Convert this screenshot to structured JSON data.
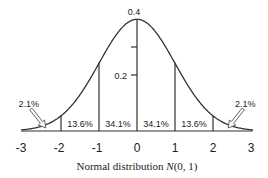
{
  "chart_data": {
    "type": "line",
    "title": "",
    "xlabel_prefix": "Normal distribution ",
    "xlabel_symbol": "N",
    "xlabel_suffix": "(0, 1)",
    "ylabel": "",
    "xlim": [
      -3,
      3
    ],
    "ylim": [
      0,
      0.4
    ],
    "x_ticks": [
      -3,
      -2,
      -1,
      0,
      1,
      2,
      3
    ],
    "x_tick_labels": [
      "-3",
      "-2",
      "-1",
      "0",
      "1",
      "2",
      "3"
    ],
    "y_ticks": [
      0.2,
      0.3,
      0.4
    ],
    "y_tick_labels": [
      {
        "value": 0.2,
        "label": "0.2"
      },
      {
        "value": 0.4,
        "label": "0.4"
      }
    ],
    "series": [
      {
        "name": "N(0,1) density",
        "function": "standard_normal_pdf",
        "x_range": [
          -3.05,
          3.05
        ]
      }
    ],
    "dividers": [
      -2,
      -1,
      1,
      2
    ],
    "regions": [
      {
        "from": -1,
        "to": 0,
        "label": "34.1%"
      },
      {
        "from": 0,
        "to": 1,
        "label": "34.1%"
      },
      {
        "from": -2,
        "to": -1,
        "label": "13.6%"
      },
      {
        "from": 1,
        "to": 2,
        "label": "13.6%"
      }
    ],
    "annotations": [
      {
        "label": "2.1%",
        "side": "left",
        "points_to_x": -2.4
      },
      {
        "label": "2.1%",
        "side": "right",
        "points_to_x": 2.4
      }
    ],
    "grid": false,
    "legend": "none"
  }
}
